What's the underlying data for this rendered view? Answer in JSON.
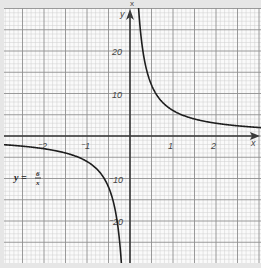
{
  "chart_data": {
    "type": "line",
    "title": "",
    "function": "y = 6/x",
    "equation_label": {
      "lhs": "y =",
      "numerator": "6",
      "denominator": "x"
    },
    "xlabel": "x",
    "ylabel": "y",
    "top_cropped_label": "x",
    "xlim": [
      -2.93,
      3.0
    ],
    "ylim": [
      -30.0,
      30.0
    ],
    "x_ticks": [
      {
        "value": -2,
        "label": "⁻2"
      },
      {
        "value": -1,
        "label": "⁻1"
      },
      {
        "value": 1,
        "label": "1"
      },
      {
        "value": 2,
        "label": "2"
      }
    ],
    "y_ticks": [
      {
        "value": 20,
        "label": "20"
      },
      {
        "value": 10,
        "label": "10"
      },
      {
        "value": -10,
        "label": "⁻10"
      },
      {
        "value": -20,
        "label": "⁻20"
      }
    ],
    "grid": {
      "on": true,
      "minor_per_major": 5,
      "major_x_units": 0.5,
      "major_y_units": 5
    },
    "series": [
      {
        "name": "y = 6/x",
        "x": [
          -2.9,
          -2.5,
          -2,
          -1.5,
          -1,
          -0.75,
          -0.5,
          -0.4,
          -0.3,
          -0.25,
          -0.2,
          0.2,
          0.25,
          0.3,
          0.4,
          0.5,
          0.75,
          1,
          1.5,
          2,
          2.5,
          3
        ],
        "values": [
          -2.07,
          -2.4,
          -3,
          -4,
          -6,
          -8,
          -12,
          -15,
          -20,
          -24,
          -30,
          30,
          24,
          20,
          15,
          12,
          8,
          6,
          4,
          3,
          2.4,
          2
        ]
      }
    ]
  },
  "colors": {
    "background": "#e6e6e6",
    "paper": "#fafafa",
    "minor_grid": "#cfcfcf",
    "major_grid": "#8f8f8f",
    "axis": "#3a3a3a",
    "curve": "#1e1e1e"
  }
}
